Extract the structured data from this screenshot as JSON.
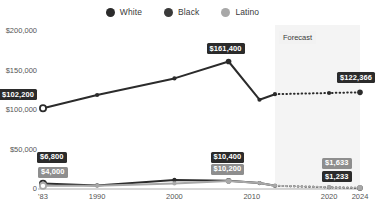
{
  "legend": {
    "items": [
      {
        "label": "White",
        "color": "#2b2b2b",
        "icon": "circle-marker-icon"
      },
      {
        "label": "Black",
        "color": "#3a3a3a",
        "icon": "circle-marker-icon"
      },
      {
        "label": "Latino",
        "color": "#a8a8a8",
        "icon": "circle-marker-icon"
      }
    ]
  },
  "annotations": {
    "forecast_label": "Forecast"
  },
  "chart_data": {
    "type": "line",
    "title": "",
    "subtitle": "",
    "xlabel": "",
    "ylabel": "",
    "x": [
      "'83",
      "1990",
      "2000",
      "2007",
      "2011",
      "2013",
      "2020",
      "2024"
    ],
    "xtick_labels": [
      "'83",
      "1990",
      "2000",
      "2010",
      "2020",
      "2024"
    ],
    "xtick_values": [
      1983,
      1990,
      2000,
      2010,
      2020,
      2024
    ],
    "ytick_labels": [
      "0",
      "$50,000",
      "$100,000",
      "$150,000",
      "$200,000"
    ],
    "ytick_values": [
      0,
      50000,
      100000,
      150000,
      200000
    ],
    "ylim": [
      0,
      200000
    ],
    "xlim": [
      1983,
      2024
    ],
    "grid": false,
    "legend_position": "top-center",
    "forecast_from": 2013,
    "series": [
      {
        "name": "White",
        "color": "#2b2b2b",
        "points": [
          {
            "x": 1983,
            "y": 102200,
            "label": "$102,200",
            "label_style": "dark"
          },
          {
            "x": 1990,
            "y": 119000
          },
          {
            "x": 2000,
            "y": 140000
          },
          {
            "x": 2007,
            "y": 161400,
            "label": "$161,400",
            "label_style": "dark"
          },
          {
            "x": 2011,
            "y": 113000
          },
          {
            "x": 2013,
            "y": 120000
          },
          {
            "x": 2020,
            "y": 121500
          },
          {
            "x": 2024,
            "y": 122366,
            "label": "$122,366",
            "label_style": "dark"
          }
        ]
      },
      {
        "name": "Black",
        "color": "#2b2b2b",
        "points": [
          {
            "x": 1983,
            "y": 6800,
            "label": "$6,800",
            "label_style": "dark"
          },
          {
            "x": 1990,
            "y": 4500
          },
          {
            "x": 2000,
            "y": 11500
          },
          {
            "x": 2007,
            "y": 10400,
            "label": "$10,400",
            "label_style": "dark"
          },
          {
            "x": 2011,
            "y": 7500
          },
          {
            "x": 2013,
            "y": 4000
          },
          {
            "x": 2020,
            "y": 2200
          },
          {
            "x": 2024,
            "y": 1233,
            "label": "$1,233",
            "label_style": "dark"
          }
        ]
      },
      {
        "name": "Latino",
        "color": "#a8a8a8",
        "points": [
          {
            "x": 1983,
            "y": 4000,
            "label": "$4,000",
            "label_style": "gray"
          },
          {
            "x": 1990,
            "y": 4200
          },
          {
            "x": 2000,
            "y": 7000
          },
          {
            "x": 2007,
            "y": 10200,
            "label": "$10,200",
            "label_style": "gray"
          },
          {
            "x": 2011,
            "y": 7600
          },
          {
            "x": 2013,
            "y": 4200
          },
          {
            "x": 2020,
            "y": 2400
          },
          {
            "x": 2024,
            "y": 1633,
            "label": "$1,633",
            "label_style": "gray"
          }
        ]
      }
    ]
  }
}
